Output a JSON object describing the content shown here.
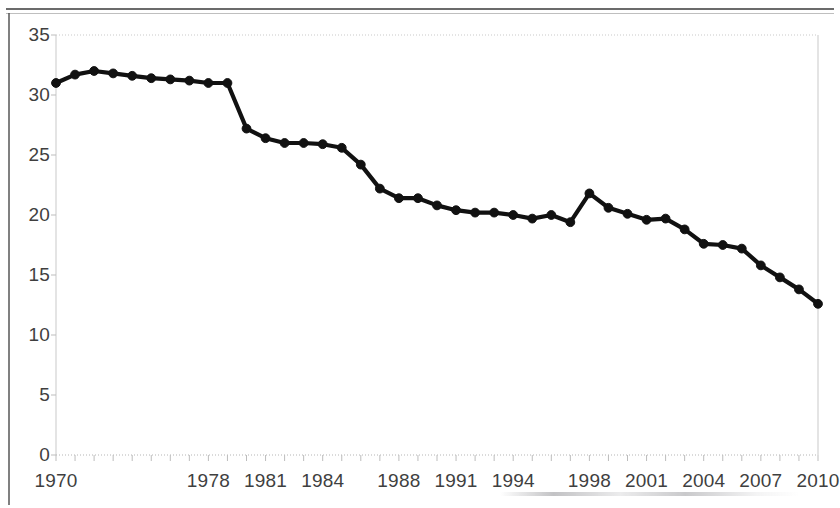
{
  "chart_data": {
    "type": "line",
    "title": "",
    "subtitle": "",
    "xlabel": "",
    "ylabel": "",
    "xlim": [
      1970,
      2010
    ],
    "ylim": [
      0,
      35
    ],
    "y_ticks": [
      0,
      5,
      10,
      15,
      20,
      25,
      30,
      35
    ],
    "x_tick_labels": [
      "1970",
      "1978",
      "1981",
      "1984",
      "1988",
      "1991",
      "1994",
      "1998",
      "2001",
      "2004",
      "2007",
      "2010"
    ],
    "x_tick_years": [
      1970,
      1978,
      1981,
      1984,
      1988,
      1991,
      1994,
      1998,
      2001,
      2004,
      2007,
      2010
    ],
    "grid": false,
    "legend": "none",
    "series": [
      {
        "name": "series-1",
        "color": "#111111",
        "marker": "circle",
        "x": [
          1970,
          1971,
          1972,
          1973,
          1974,
          1975,
          1976,
          1977,
          1978,
          1979,
          1980,
          1981,
          1982,
          1983,
          1984,
          1985,
          1986,
          1987,
          1988,
          1989,
          1990,
          1991,
          1992,
          1993,
          1994,
          1995,
          1996,
          1997,
          1998,
          1999,
          2000,
          2001,
          2002,
          2003,
          2004,
          2005,
          2006,
          2007,
          2008,
          2009,
          2010
        ],
        "values": [
          31.0,
          31.7,
          32.0,
          31.8,
          31.6,
          31.4,
          31.3,
          31.2,
          31.0,
          31.0,
          27.2,
          26.4,
          26.0,
          26.0,
          25.9,
          25.6,
          24.2,
          22.2,
          21.4,
          21.4,
          20.8,
          20.4,
          20.2,
          20.2,
          20.0,
          19.7,
          20.0,
          19.4,
          21.8,
          20.6,
          20.1,
          19.6,
          19.7,
          18.8,
          17.6,
          17.5,
          17.2,
          15.8,
          14.8,
          13.8,
          12.6
        ]
      }
    ]
  },
  "axes": {
    "y_tick_labels": [
      "35",
      "30",
      "25",
      "20",
      "15",
      "10",
      "5",
      "0"
    ]
  }
}
